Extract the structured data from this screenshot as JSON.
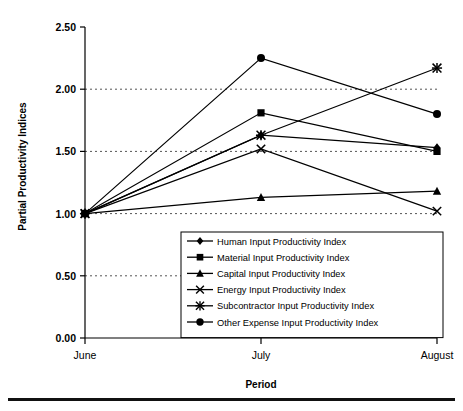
{
  "chart_data": {
    "type": "line",
    "title": "",
    "xlabel": "Period",
    "ylabel": "Partial Productivity Indices",
    "categories": [
      "June",
      "July",
      "August"
    ],
    "ylim": [
      0.0,
      2.5
    ],
    "yticks": [
      "0.00",
      "0.50",
      "1.00",
      "1.50",
      "2.00",
      "2.50"
    ],
    "ytick_values": [
      0.0,
      0.5,
      1.0,
      1.5,
      2.0,
      2.5
    ],
    "grid": "horizontal-dashed",
    "legend_position": "inside-lower-center",
    "series": [
      {
        "name": "Human Input Productivity Index",
        "marker": "diamond",
        "values": [
          1.0,
          1.63,
          1.53
        ]
      },
      {
        "name": "Material Input Productivity Index",
        "marker": "square",
        "values": [
          1.0,
          1.81,
          1.5
        ]
      },
      {
        "name": "Capital Input Productivity Index",
        "marker": "triangle",
        "values": [
          1.0,
          1.13,
          1.18
        ]
      },
      {
        "name": "Energy Input Productivity Index",
        "marker": "cross",
        "values": [
          1.0,
          1.52,
          1.02
        ]
      },
      {
        "name": "Subcontractor Input Productivity Index",
        "marker": "star",
        "values": [
          1.0,
          1.63,
          2.17
        ]
      },
      {
        "name": "Other Expense Input Productivity Index",
        "marker": "circle",
        "values": [
          1.0,
          2.25,
          1.8
        ]
      }
    ]
  },
  "axis": {
    "ylabel": "Partial Productivity Indices",
    "xlabel": "Period"
  },
  "colors": {
    "line": "#000000",
    "grid": "#555555",
    "background": "#ffffff"
  }
}
